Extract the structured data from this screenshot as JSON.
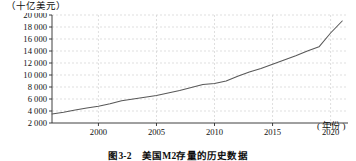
{
  "figure": {
    "unit_label": "（十亿美元）",
    "xaxis_unit": "( 年份 )",
    "caption": "图3-2　美国M2存量的历史数据"
  },
  "chart_data": {
    "type": "line",
    "title": "图3-2　美国M2存量的历史数据",
    "xlabel": "( 年份 )",
    "ylabel": "（十亿美元）",
    "xlim": [
      1996,
      2021.5
    ],
    "ylim": [
      2000,
      20000
    ],
    "grid": true,
    "legend": "none",
    "xticks": [
      2000,
      2005,
      2010,
      2015,
      2020
    ],
    "xtick_labels": [
      "2000",
      "2005",
      "2010",
      "2015",
      "2020"
    ],
    "yticks": [
      2000,
      4000,
      6000,
      8000,
      10000,
      12000,
      14000,
      16000,
      18000,
      20000
    ],
    "ytick_labels": [
      "2 000",
      "4 000",
      "6 000",
      "8 000",
      "10 000",
      "12 000",
      "14 000",
      "16 000",
      "18 000",
      "20 000"
    ],
    "line_color": "#585858",
    "series": [
      {
        "name": "美国M2存量",
        "x": [
          1996,
          1997,
          1998,
          1999,
          2000,
          2001,
          2002,
          2003,
          2004,
          2005,
          2006,
          2007,
          2008,
          2009,
          2010,
          2011,
          2012,
          2013,
          2014,
          2015,
          2016,
          2017,
          2018,
          2019,
          2020,
          2021
        ],
        "values": [
          3500,
          3800,
          4150,
          4500,
          4800,
          5200,
          5700,
          6000,
          6300,
          6600,
          7000,
          7400,
          7900,
          8400,
          8600,
          9000,
          9800,
          10500,
          11100,
          11800,
          12500,
          13200,
          14000,
          14700,
          17000,
          19000
        ]
      }
    ]
  }
}
